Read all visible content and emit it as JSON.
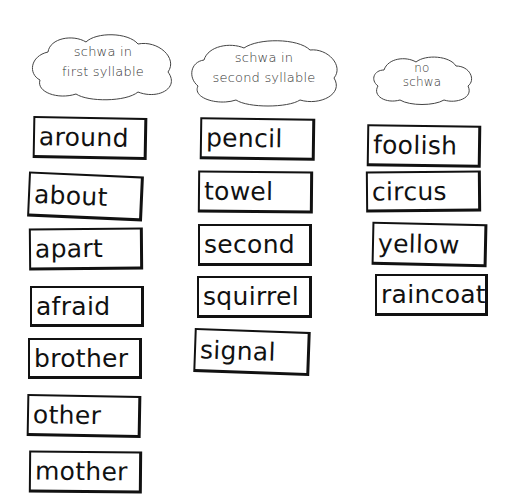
{
  "categories": [
    {
      "label_line1": "schwa in",
      "label_line2": "first syllable",
      "words": [
        "around",
        "about",
        "apart",
        "afraid",
        "brother",
        "other",
        "mother"
      ]
    },
    {
      "label_line1": "schwa in",
      "label_line2": "second syllable",
      "words": [
        "pencil",
        "towel",
        "second",
        "squirrel",
        "signal"
      ]
    },
    {
      "label_line1": "no",
      "label_line2": "schwa",
      "words": [
        "foolish",
        "circus",
        "yellow",
        "raincoat"
      ]
    }
  ]
}
